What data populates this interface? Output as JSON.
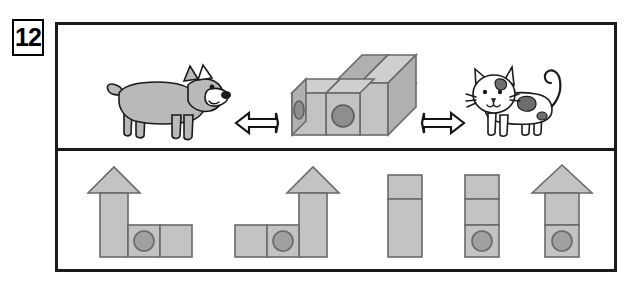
{
  "question": {
    "number": "12",
    "type": "spatial-reasoning-block-views"
  },
  "top_panel": {
    "left_observer": {
      "name": "dog",
      "facing": "right",
      "body_color": "#b9b9b9"
    },
    "right_observer": {
      "name": "cat",
      "facing": "left",
      "body_color": "#ffffff",
      "spot_color": "#6e6e6e"
    },
    "left_arrow": {
      "icon": "arrow-right-icon",
      "direction": "right"
    },
    "right_arrow": {
      "icon": "arrow-left-icon",
      "direction": "left"
    },
    "structure": {
      "description": "3D block structure",
      "blocks": [
        {
          "id": "cube-left",
          "shape": "cube",
          "hole": true,
          "hole_face": "left-side"
        },
        {
          "id": "cube-middle",
          "shape": "cube",
          "hole": true,
          "hole_face": "front"
        },
        {
          "id": "tower-right",
          "shape": "tall-block",
          "hole": false
        },
        {
          "id": "roof",
          "shape": "triangular-prism",
          "hole": false
        }
      ],
      "fill_color": "#c3c3c3",
      "outline_color": "#6a6a6a"
    }
  },
  "bottom_panel": {
    "label": "answer options",
    "options": [
      {
        "index": 1,
        "name": "option-1",
        "description": "tall tower with roof on left plus two squares to the right, circle in middle square",
        "roof": true,
        "roof_side": "left",
        "columns": 3,
        "circle_position": "middle-bottom"
      },
      {
        "index": 2,
        "name": "option-2",
        "description": "two squares on left plus tall tower with roof on right, circle in middle square",
        "roof": true,
        "roof_side": "right",
        "columns": 3,
        "circle_position": "middle-bottom"
      },
      {
        "index": 3,
        "name": "option-3",
        "description": "plain tall rectangle split into a short top segment and a long lower segment, no roof, no circle",
        "roof": false,
        "segments": 2,
        "circle_position": "none"
      },
      {
        "index": 4,
        "name": "option-4",
        "description": "tall rectangle of three stacked segments with circle in the bottom segment, no roof",
        "roof": false,
        "segments": 3,
        "circle_position": "bottom"
      },
      {
        "index": 5,
        "name": "option-5",
        "description": "tower with triangular roof and circle in bottom segment",
        "roof": true,
        "segments": 2,
        "circle_position": "bottom"
      }
    ]
  },
  "colors": {
    "frame": "#1a1a1a",
    "block_face": "#c3c3c3",
    "block_top": "#cfcfcf",
    "block_side": "#b0b0b0",
    "block_outline": "#6a6a6a",
    "hole": "#a0a0a0",
    "background": "#ffffff"
  }
}
